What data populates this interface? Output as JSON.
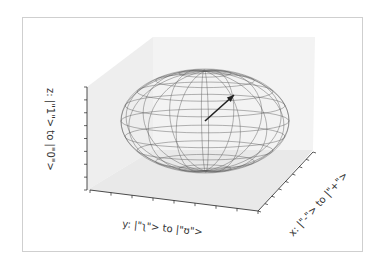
{
  "chart_data": {
    "type": "bloch-sphere-3d",
    "title": "",
    "axes": {
      "x": {
        "label": "x: |\"-\"> to |\"+\">"
      },
      "y": {
        "label": "y: |\"ʅ\"> to |\"ʊ\">"
      },
      "z": {
        "label": "z: |\"1\"> to |\"0\">"
      }
    },
    "sphere": {
      "wireframe": true,
      "meridians": 16,
      "parallels": 10,
      "color": "#555555"
    },
    "vector": {
      "x": 0.35,
      "y": 0.35,
      "z": 0.45,
      "color": "#222222"
    },
    "panes": {
      "color": "#ececec"
    },
    "grid": false
  }
}
